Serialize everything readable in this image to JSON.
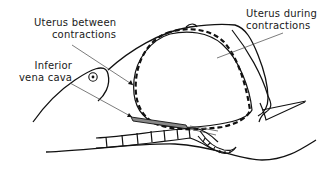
{
  "labels": {
    "uterus_between": {
      "line1": "Uterus between",
      "line2": "contractions"
    },
    "vena_cava": {
      "line1": "Inferior",
      "line2": "vena cava"
    },
    "uterus_during": {
      "line1": "Uterus during",
      "line2": "contractions"
    }
  },
  "colors": {
    "ink": "#111111",
    "leader": "#555555",
    "hatch": "#777777"
  }
}
